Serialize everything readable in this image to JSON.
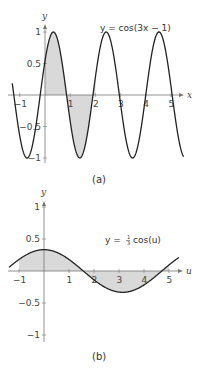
{
  "chart_data": [
    {
      "type": "line",
      "caption": "(a)",
      "equation": "y = cos(3x − 1)",
      "function": "cos(3x-1)",
      "xlabel": "x",
      "ylabel": "y",
      "xlim": [
        -1.3,
        5.5
      ],
      "ylim": [
        -1,
        1
      ],
      "xticks": [
        "−1",
        "1",
        "2",
        "3",
        "4",
        "5"
      ],
      "xtick_values": [
        -1,
        1,
        2,
        3,
        4,
        5
      ],
      "yticks": [
        "1",
        "0.5",
        "−0.5",
        "−1"
      ],
      "ytick_values": [
        1,
        0.5,
        -0.5,
        -1
      ],
      "shaded_region": {
        "from": 0,
        "to": 2,
        "color": "#d9d9d9"
      },
      "line_color": "#222222",
      "grid": false
    },
    {
      "type": "line",
      "caption": "(b)",
      "equation_prefix": "y = ",
      "equation_frac_num": "1",
      "equation_frac_den": "3",
      "equation_suffix": "cos(u)",
      "function": "(1/3)cos(u)",
      "xlabel": "u",
      "ylabel": "y",
      "xlim": [
        -1.4,
        5.4
      ],
      "ylim": [
        -1,
        1
      ],
      "xticks": [
        "−1",
        "1",
        "2",
        "3",
        "4",
        "5"
      ],
      "xtick_values": [
        -1,
        1,
        2,
        3,
        4,
        5
      ],
      "yticks": [
        "1",
        "0.5",
        "−0.5",
        "−1"
      ],
      "ytick_values": [
        1,
        0.5,
        -0.5,
        -1
      ],
      "shaded_region": {
        "from": -1,
        "to": 5,
        "color": "#d9d9d9"
      },
      "line_color": "#222222",
      "grid": false
    }
  ]
}
